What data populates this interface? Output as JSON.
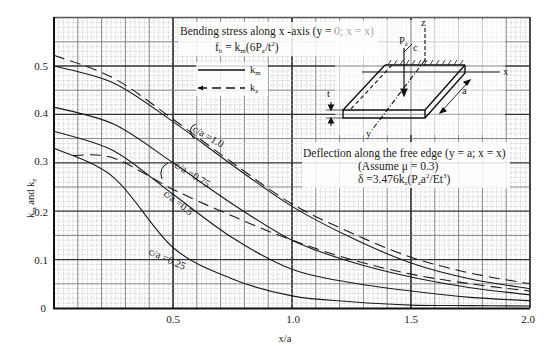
{
  "chart_data": {
    "type": "line",
    "title": "Bending stress along x -axis (y = 0; x = x)",
    "subtitle": "f_b = k_m(6P_z/t^2)",
    "xlabel": "x/a",
    "ylabel": "k_m and k_z",
    "xlim": [
      0,
      2.0
    ],
    "ylim": [
      0,
      0.55
    ],
    "x_ticks": [
      "0.5",
      "1.0",
      "1.5",
      "2.0"
    ],
    "y_ticks": [
      "0",
      "0.1",
      "0.2",
      "0.3",
      "0.4",
      "0.5"
    ],
    "grid": true,
    "legend": [
      {
        "label": "k_m",
        "style": "solid"
      },
      {
        "label": "k_z",
        "style": "dashed"
      }
    ],
    "annotations": [
      "Deflection along the free edge (y = a; x = x)",
      "(Assume  μ = 0.3)",
      "δ =3.476k_z(P_z a^2/Et^3)",
      "c/a =1.0",
      "c/a =0.75",
      "c/a =0.5",
      "c/a =0.25"
    ],
    "x": [
      0,
      0.25,
      0.5,
      0.75,
      1.0,
      1.25,
      1.5,
      1.75,
      2.0
    ],
    "series": [
      {
        "name": "k_m, c/a=1.0",
        "style": "solid",
        "values": [
          0.5,
          0.465,
          0.385,
          0.295,
          0.21,
          0.145,
          0.093,
          0.06,
          0.04
        ]
      },
      {
        "name": "k_z, c/a=1.0",
        "style": "dashed",
        "values": [
          0.522,
          0.475,
          0.39,
          0.3,
          0.215,
          0.155,
          0.105,
          0.072,
          0.05
        ]
      },
      {
        "name": "k_m, c/a=0.75",
        "style": "solid",
        "values": [
          0.415,
          0.38,
          0.3,
          0.215,
          0.14,
          0.095,
          0.064,
          0.042,
          0.027
        ]
      },
      {
        "name": "k_z, c/a=0.75",
        "style": "dashed",
        "values": [
          null,
          0.31,
          0.245,
          0.19,
          0.14,
          0.1,
          0.07,
          0.05,
          0.035
        ]
      },
      {
        "name": "k_m, c/a=0.5",
        "style": "solid",
        "values": [
          0.365,
          0.325,
          0.235,
          0.145,
          0.08,
          0.052,
          0.035,
          0.022,
          0.015
        ]
      },
      {
        "name": "k_m, c/a=0.25",
        "style": "solid",
        "values": [
          0.33,
          0.27,
          0.125,
          0.06,
          0.025,
          0.013,
          0.006,
          0.005,
          0.004
        ]
      }
    ]
  },
  "text": {
    "title": "Bending stress along x -axis (y = 0; x = x)",
    "formula_fb": "f",
    "formula_fb_sub": "b",
    "formula_fb_rest": " = k",
    "formula_km_sub": "m",
    "formula_fb_tail": "(6P",
    "formula_pz_sub": "z",
    "formula_fb_end": "/t",
    "formula_sq": "2",
    "formula_close": ")",
    "legend_km": "k",
    "legend_km_sub": "m",
    "legend_kz": "k",
    "legend_kz_sub": "z",
    "deflection_title": "Deflection along the free edge (y = a; x = x)",
    "assume": "(Assume  μ = 0.3)",
    "delta_a": "δ =3.476k",
    "delta_sub_z": "z",
    "delta_b": "(P",
    "delta_sub_z2": "z",
    "delta_c": "a",
    "delta_sup2": "2",
    "delta_d": "/Et",
    "delta_sup3": "3",
    "delta_e": ")",
    "ylabel_a": "k",
    "ylabel_sub_m": "m",
    "ylabel_b": " and k",
    "ylabel_sub_z": "z",
    "xlabel": "x/a",
    "ca_10": "c/a =1.0",
    "ca_075": "c/a =0.75",
    "ca_05": "c/a =0.5",
    "ca_025": "c/a =0.25",
    "diagram_pz": "P",
    "diagram_pz_sub": "z",
    "diagram_c": "c",
    "diagram_z": "z",
    "diagram_x": "x",
    "diagram_y": "y",
    "diagram_a": "a",
    "diagram_t": "t"
  }
}
